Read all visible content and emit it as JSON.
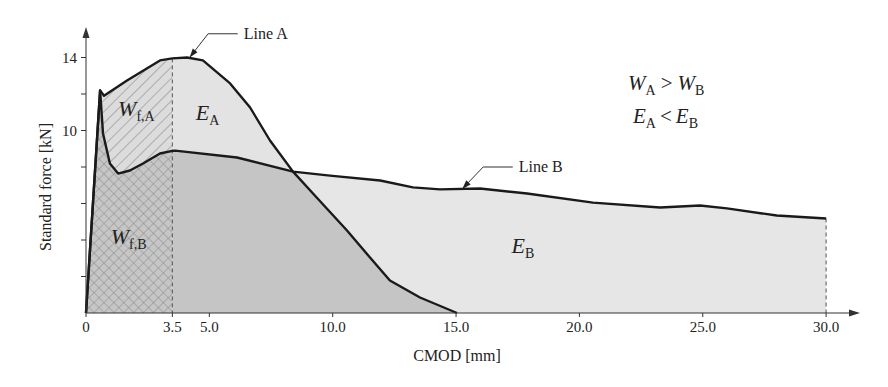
{
  "chart_data": {
    "type": "area",
    "title": "",
    "xlabel": "CMOD [mm]",
    "ylabel": "Standard force [kN]",
    "xlim": [
      0,
      30
    ],
    "ylim": [
      0,
      14
    ],
    "grid": false,
    "x_ticks": [
      {
        "value": 0,
        "label": "0"
      },
      {
        "value": 3.5,
        "label": "3.5"
      },
      {
        "value": 5,
        "label": "5.0"
      },
      {
        "value": 10,
        "label": "10.0"
      },
      {
        "value": 15,
        "label": "15.0"
      },
      {
        "value": 20,
        "label": "20.0"
      },
      {
        "value": 25,
        "label": "25.0"
      },
      {
        "value": 30,
        "label": "30.0"
      }
    ],
    "y_ticks": [
      {
        "value": 2,
        "label": ""
      },
      {
        "value": 4,
        "label": ""
      },
      {
        "value": 6,
        "label": ""
      },
      {
        "value": 8,
        "label": ""
      },
      {
        "value": 10,
        "label": "10"
      },
      {
        "value": 12,
        "label": ""
      },
      {
        "value": 14,
        "label": "14"
      }
    ],
    "split_x": 3.5,
    "series": [
      {
        "name": "Line A",
        "x": [
          0,
          0.57,
          0.73,
          1.66,
          3.0,
          3.5,
          4.1,
          4.74,
          5.84,
          6.65,
          7.46,
          8.39,
          9.2,
          10.58,
          11.51,
          12.32,
          13.54,
          15.04
        ],
        "y": [
          0,
          12.2,
          11.9,
          12.74,
          13.84,
          13.95,
          14.0,
          13.84,
          12.58,
          11.26,
          9.45,
          7.75,
          6.55,
          4.52,
          3.04,
          1.78,
          0.85,
          0
        ]
      },
      {
        "name": "Line B",
        "x": [
          0,
          0.57,
          0.69,
          0.97,
          1.3,
          1.78,
          2.31,
          3.0,
          3.5,
          3.61,
          6.12,
          8.39,
          9.89,
          11.92,
          13.25,
          14.35,
          15.97,
          17.88,
          20.55,
          23.27,
          24.89,
          25.98,
          28.0,
          30.0
        ],
        "y": [
          0,
          12.2,
          9.84,
          8.19,
          7.64,
          7.81,
          8.19,
          8.74,
          8.88,
          8.9,
          8.52,
          7.75,
          7.53,
          7.26,
          6.88,
          6.77,
          6.82,
          6.55,
          6.05,
          5.78,
          5.89,
          5.73,
          5.34,
          5.18
        ]
      }
    ],
    "callouts": [
      {
        "label": "Line A",
        "series": "Line A",
        "tip": [
          4.2,
          14.0
        ],
        "elbow": [
          4.95,
          15.3
        ],
        "end": [
          6.15,
          15.3
        ]
      },
      {
        "label": "Line B",
        "series": "Line B",
        "tip": [
          15.25,
          6.8
        ],
        "elbow": [
          16.1,
          8.0
        ],
        "end": [
          17.3,
          8.0
        ]
      }
    ],
    "area_labels": [
      {
        "id": "wfa",
        "main": "W",
        "sub": "f,A",
        "at": [
          1.3,
          10.8
        ]
      },
      {
        "id": "ea",
        "main": "E",
        "sub": "A",
        "at": [
          4.45,
          10.6
        ]
      },
      {
        "id": "wfb",
        "main": "W",
        "sub": "f,B",
        "at": [
          1.0,
          3.8
        ]
      },
      {
        "id": "eb",
        "main": "E",
        "sub": "B",
        "at": [
          17.25,
          3.3
        ]
      }
    ],
    "annotations": [
      {
        "left": "W",
        "left_sub": "A",
        "op": ">",
        "right": "W",
        "right_sub": "B"
      },
      {
        "left": "E",
        "left_sub": "A",
        "op": "<",
        "right": "E",
        "right_sub": "B"
      }
    ],
    "colors": {
      "line": "#1a1a1a",
      "axis": "#333333",
      "wfa_bg": "#dcdcdc",
      "wfa_hatch": "#8c8c8c",
      "wfb_bg": "#c6c6c6",
      "wfb_hatch": "#8a8a8a",
      "ea_fill": "#e3e3e3",
      "eb_fill": "#e6e6e6",
      "overlap_fill": "#c5c5c5"
    }
  }
}
